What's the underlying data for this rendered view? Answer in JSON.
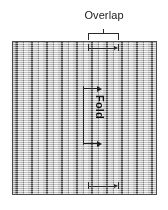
{
  "figure": {
    "type": "technical-diagram",
    "background_color": "#ffffff"
  },
  "labels": {
    "overlap": "Overlap",
    "fold": "Fold"
  },
  "bracket": {
    "name": "overlap-bracket",
    "orientation": "downward",
    "color": "#2b2b2b",
    "left_px": 88,
    "right_px": 119,
    "top_px": 29
  },
  "panel": {
    "name": "striped-fabric-panel",
    "left_px": 12,
    "top_px": 41,
    "width_px": 145,
    "height_px": 154,
    "border_color": "#4a4a4a",
    "fill_color": "#d6d6d6",
    "pattern": "vertical-dithered-stripes",
    "stripe_period_px": 15,
    "dark_stripe_color": "#3c3c3c",
    "light_stripe_color": "#ededed"
  },
  "fold_annotation": {
    "name": "fold-dimension-arrows",
    "color": "#202020",
    "arrow_direction": "right",
    "arrow_count": 2,
    "text_rotation_deg": 90
  },
  "edge_marks": {
    "name": "overlap-edge-ticks",
    "color": "#2a2a2a",
    "top_y_px": 48,
    "bottom_y_px": 186
  }
}
